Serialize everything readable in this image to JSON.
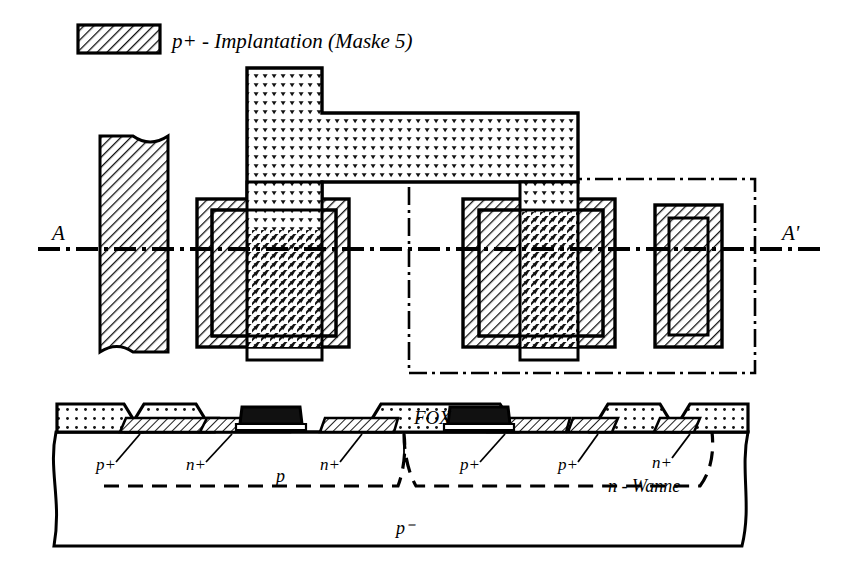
{
  "figure": {
    "title_caption": "",
    "domain_kind": "semiconductor-process-layout"
  },
  "legend": {
    "swatch_name": "p-plus-implantation-swatch",
    "swatch_pattern": "diagonal-hatch",
    "text": "p+ - Implantation (Maske 5)",
    "mask_number": "5"
  },
  "top_view": {
    "name": "layout-top-view",
    "section_line": {
      "left_label": "A",
      "right_label": "A'",
      "style": "dash-dot"
    },
    "well_boundary": {
      "label": "",
      "style": "dash-dot-rectangle"
    },
    "shapes": [
      {
        "name": "left-contact-bar",
        "pattern": "diagonal-hatch",
        "broken_ends": "true"
      },
      {
        "name": "nmos-active-square",
        "pattern": "diagonal-hatch"
      },
      {
        "name": "nmos-inner-outline",
        "pattern": "outline"
      },
      {
        "name": "polysilicon-gate-strip",
        "pattern": "stipple-dots"
      },
      {
        "name": "pmos-active-square",
        "pattern": "diagonal-hatch"
      },
      {
        "name": "pmos-inner-outline",
        "pattern": "outline"
      },
      {
        "name": "right-contact-rect",
        "pattern": "diagonal-hatch"
      },
      {
        "name": "right-contact-inner-outline",
        "pattern": "outline"
      }
    ]
  },
  "cross_section": {
    "name": "device-cross-section-A-A-prime",
    "fox_label": "FOX",
    "substrate_label": "p⁻",
    "epi_label": "p",
    "well_label": "n - Wanne",
    "doping_labels": [
      {
        "id": "xs-pplus-1",
        "text": "p+"
      },
      {
        "id": "xs-nplus-1",
        "text": "n+"
      },
      {
        "id": "xs-nplus-2",
        "text": "n+"
      },
      {
        "id": "xs-pplus-2",
        "text": "p+"
      },
      {
        "id": "xs-pplus-3",
        "text": "p+"
      },
      {
        "id": "xs-nplus-3",
        "text": "n+"
      }
    ],
    "gates": [
      {
        "name": "nmos-poly-gate",
        "fill": "solid-black"
      },
      {
        "name": "pmos-poly-gate",
        "fill": "solid-black"
      }
    ]
  },
  "colors": {
    "ink": "#000000",
    "paper": "#ffffff",
    "hatch": "#000000",
    "stipple": "#000000"
  }
}
